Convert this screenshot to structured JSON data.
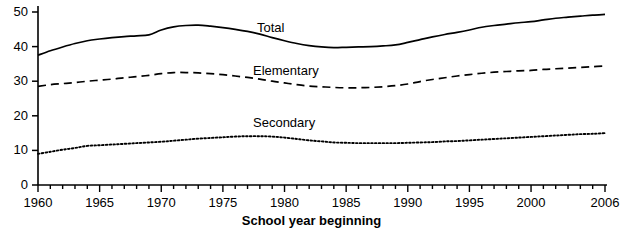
{
  "chart_data": {
    "type": "line",
    "title": "",
    "subtitle": "",
    "xlabel": "School year beginning",
    "ylabel": "",
    "xlim": [
      1960,
      2006
    ],
    "ylim": [
      0,
      50
    ],
    "grid": false,
    "legend_position": "inline-right-of-series",
    "x_ticks_major": [
      1960,
      1965,
      1970,
      1975,
      1980,
      1985,
      1990,
      1995,
      2000,
      2006
    ],
    "x_tick_labels": [
      "1960",
      "1965",
      "1970",
      "1975",
      "1980",
      "1985",
      "1990",
      "1995",
      "2000",
      "2006"
    ],
    "x_minor_tick_step": 1,
    "y_ticks": [
      0,
      10,
      20,
      30,
      40,
      50
    ],
    "y_tick_labels": [
      "0",
      "10",
      "20",
      "30",
      "40",
      "50"
    ],
    "x": [
      1960,
      1961,
      1962,
      1963,
      1964,
      1965,
      1966,
      1967,
      1968,
      1969,
      1970,
      1971,
      1972,
      1973,
      1974,
      1975,
      1976,
      1977,
      1978,
      1979,
      1980,
      1981,
      1982,
      1983,
      1984,
      1985,
      1986,
      1987,
      1988,
      1989,
      1990,
      1991,
      1992,
      1993,
      1994,
      1995,
      1996,
      1997,
      1998,
      1999,
      2000,
      2001,
      2002,
      2003,
      2004,
      2005,
      2006
    ],
    "series": [
      {
        "name": "Total",
        "label": "Total",
        "linestyle": "solid",
        "color": "#000000",
        "values": [
          37.5,
          38.8,
          39.9,
          40.9,
          41.7,
          42.2,
          42.6,
          42.9,
          43.1,
          43.4,
          44.8,
          45.7,
          46.1,
          46.2,
          45.9,
          45.5,
          45.0,
          44.4,
          43.6,
          42.6,
          41.7,
          40.9,
          40.3,
          39.9,
          39.7,
          39.8,
          39.9,
          40.0,
          40.2,
          40.5,
          41.2,
          42.0,
          42.8,
          43.5,
          44.1,
          44.8,
          45.6,
          46.1,
          46.5,
          46.9,
          47.2,
          47.7,
          48.2,
          48.5,
          48.8,
          49.1,
          49.3
        ]
      },
      {
        "name": "Elementary",
        "label": "Elementary",
        "linestyle": "dashed",
        "color": "#000000",
        "values": [
          28.5,
          29.0,
          29.3,
          29.6,
          30.0,
          30.3,
          30.6,
          31.0,
          31.3,
          31.7,
          32.2,
          32.5,
          32.5,
          32.4,
          32.2,
          31.9,
          31.5,
          31.1,
          30.6,
          30.0,
          29.5,
          29.0,
          28.6,
          28.4,
          28.2,
          28.1,
          28.1,
          28.2,
          28.4,
          28.7,
          29.2,
          29.9,
          30.5,
          31.0,
          31.5,
          31.9,
          32.3,
          32.6,
          32.8,
          33.0,
          33.1,
          33.4,
          33.6,
          33.8,
          34.0,
          34.2,
          34.4
        ]
      },
      {
        "name": "Secondary",
        "label": "Secondary",
        "linestyle": "dotted",
        "color": "#000000",
        "values": [
          9.0,
          9.6,
          10.2,
          10.7,
          11.3,
          11.5,
          11.7,
          11.9,
          12.1,
          12.3,
          12.5,
          12.8,
          13.1,
          13.4,
          13.6,
          13.8,
          14.0,
          14.1,
          14.1,
          14.0,
          13.7,
          13.3,
          12.9,
          12.6,
          12.3,
          12.2,
          12.1,
          12.1,
          12.1,
          12.1,
          12.2,
          12.3,
          12.4,
          12.6,
          12.7,
          12.9,
          13.1,
          13.3,
          13.5,
          13.7,
          13.9,
          14.1,
          14.3,
          14.5,
          14.7,
          14.8,
          15.0
        ]
      }
    ]
  },
  "axis": {
    "x_title": "School year beginning"
  }
}
